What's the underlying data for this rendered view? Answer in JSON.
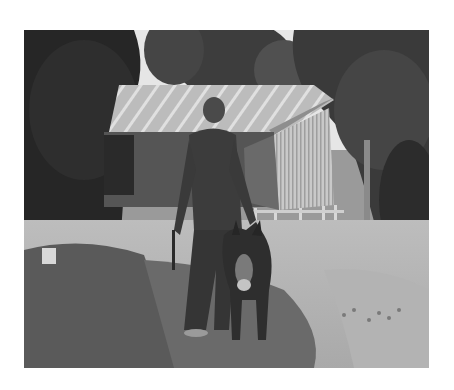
{
  "image": {
    "alt": "Black-and-white photograph of an elderly man standing beside a small donkey in a yard in front of a hut with a corrugated metal roof, surrounded by trees",
    "tone": "grayscale",
    "subjects": [
      "man",
      "donkey",
      "hut",
      "trees",
      "yard"
    ],
    "colors": {
      "sky": "#f2f2f2",
      "foliage_dark": "#2a2a2a",
      "foliage_mid": "#4a4a4a",
      "roof": "#b8b8b8",
      "wall_light": "#c9c9c9",
      "wall_dark": "#5a5a5a",
      "ground_light": "#c8c8c8",
      "ground_shadow": "#5c5c5c",
      "figure": "#3a3a3a"
    }
  }
}
